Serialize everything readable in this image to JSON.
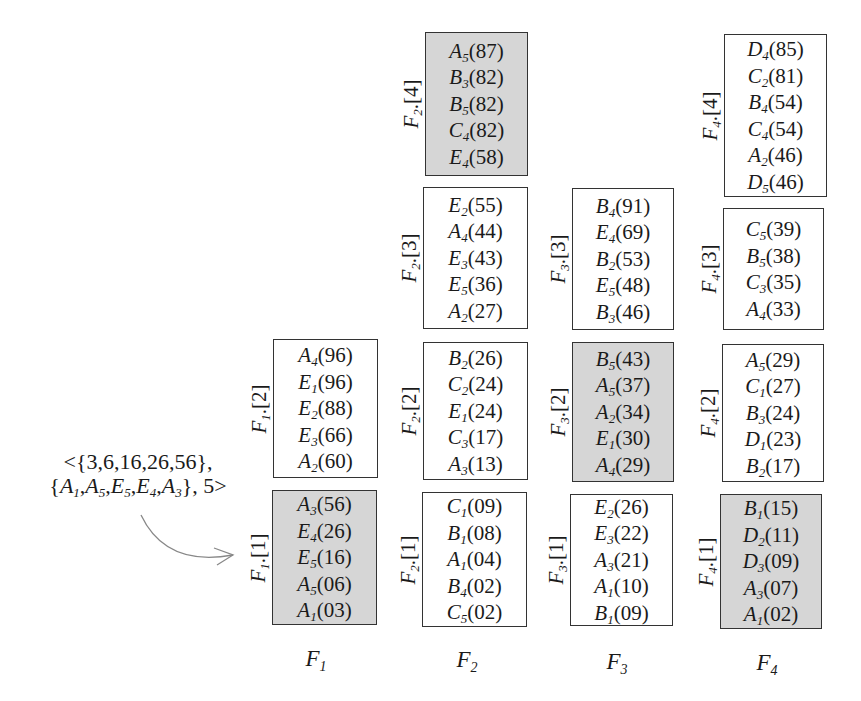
{
  "annotation": {
    "line1": "<{3,6,16,26,56},",
    "line2_sets": [
      {
        "letter": "A",
        "sub": "1"
      },
      {
        "letter": "A",
        "sub": "5"
      },
      {
        "letter": "E",
        "sub": "5"
      },
      {
        "letter": "E",
        "sub": "4"
      },
      {
        "letter": "A",
        "sub": "3"
      }
    ],
    "line2_suffix": ", 5>",
    "arrow_target": "F1.[1]"
  },
  "columns": [
    {
      "name": "F",
      "sub": "1",
      "cells": [
        {
          "label_prefix": "F",
          "label_sub": "1",
          "index": "[2]",
          "highlighted": false,
          "entries": [
            {
              "letter": "A",
              "sub": "4",
              "value": "(96)"
            },
            {
              "letter": "E",
              "sub": "1",
              "value": "(96)"
            },
            {
              "letter": "E",
              "sub": "2",
              "value": "(88)"
            },
            {
              "letter": "E",
              "sub": "3",
              "value": "(66)"
            },
            {
              "letter": "A",
              "sub": "2",
              "value": "(60)"
            }
          ]
        },
        {
          "label_prefix": "F",
          "label_sub": "1",
          "index": "[1]",
          "highlighted": true,
          "entries": [
            {
              "letter": "A",
              "sub": "3",
              "value": "(56)"
            },
            {
              "letter": "E",
              "sub": "4",
              "value": "(26)"
            },
            {
              "letter": "E",
              "sub": "5",
              "value": "(16)"
            },
            {
              "letter": "A",
              "sub": "5",
              "value": "(06)"
            },
            {
              "letter": "A",
              "sub": "1",
              "value": "(03)"
            }
          ]
        }
      ]
    },
    {
      "name": "F",
      "sub": "2",
      "cells": [
        {
          "label_prefix": "F",
          "label_sub": "2",
          "index": "[4]",
          "highlighted": true,
          "entries": [
            {
              "letter": "A",
              "sub": "5",
              "value": "(87)"
            },
            {
              "letter": "B",
              "sub": "3",
              "value": "(82)"
            },
            {
              "letter": "B",
              "sub": "5",
              "value": "(82)"
            },
            {
              "letter": "C",
              "sub": "4",
              "value": "(82)"
            },
            {
              "letter": "E",
              "sub": "4",
              "value": "(58)"
            }
          ]
        },
        {
          "label_prefix": "F",
          "label_sub": "2",
          "index": "[3]",
          "highlighted": false,
          "entries": [
            {
              "letter": "E",
              "sub": "2",
              "value": "(55)"
            },
            {
              "letter": "A",
              "sub": "4",
              "value": "(44)"
            },
            {
              "letter": "E",
              "sub": "3",
              "value": "(43)"
            },
            {
              "letter": "E",
              "sub": "5",
              "value": "(36)"
            },
            {
              "letter": "A",
              "sub": "2",
              "value": "(27)"
            }
          ]
        },
        {
          "label_prefix": "F",
          "label_sub": "2",
          "index": "[2]",
          "highlighted": false,
          "entries": [
            {
              "letter": "B",
              "sub": "2",
              "value": "(26)"
            },
            {
              "letter": "C",
              "sub": "2",
              "value": "(24)"
            },
            {
              "letter": "E",
              "sub": "1",
              "value": "(24)"
            },
            {
              "letter": "C",
              "sub": "3",
              "value": "(17)"
            },
            {
              "letter": "A",
              "sub": "3",
              "value": "(13)"
            }
          ]
        },
        {
          "label_prefix": "F",
          "label_sub": "2",
          "index": "[1]",
          "highlighted": false,
          "entries": [
            {
              "letter": "C",
              "sub": "1",
              "value": "(09)"
            },
            {
              "letter": "B",
              "sub": "1",
              "value": "(08)"
            },
            {
              "letter": "A",
              "sub": "1",
              "value": "(04)"
            },
            {
              "letter": "B",
              "sub": "4",
              "value": "(02)"
            },
            {
              "letter": "C",
              "sub": "5",
              "value": "(02)"
            }
          ]
        }
      ]
    },
    {
      "name": "F",
      "sub": "3",
      "cells": [
        {
          "label_prefix": "F",
          "label_sub": "3",
          "index": "[3]",
          "highlighted": false,
          "entries": [
            {
              "letter": "B",
              "sub": "4",
              "value": "(91)"
            },
            {
              "letter": "E",
              "sub": "4",
              "value": "(69)"
            },
            {
              "letter": "B",
              "sub": "2",
              "value": "(53)"
            },
            {
              "letter": "E",
              "sub": "5",
              "value": "(48)"
            },
            {
              "letter": "B",
              "sub": "3",
              "value": "(46)"
            }
          ]
        },
        {
          "label_prefix": "F",
          "label_sub": "3",
          "index": "[2]",
          "highlighted": true,
          "entries": [
            {
              "letter": "B",
              "sub": "5",
              "value": "(43)"
            },
            {
              "letter": "A",
              "sub": "5",
              "value": "(37)"
            },
            {
              "letter": "A",
              "sub": "2",
              "value": "(34)"
            },
            {
              "letter": "E",
              "sub": "1",
              "value": "(30)"
            },
            {
              "letter": "A",
              "sub": "4",
              "value": "(29)"
            }
          ]
        },
        {
          "label_prefix": "F",
          "label_sub": "3",
          "index": "[1]",
          "highlighted": false,
          "entries": [
            {
              "letter": "E",
              "sub": "2",
              "value": "(26)"
            },
            {
              "letter": "E",
              "sub": "3",
              "value": "(22)"
            },
            {
              "letter": "A",
              "sub": "3",
              "value": "(21)"
            },
            {
              "letter": "A",
              "sub": "1",
              "value": "(10)"
            },
            {
              "letter": "B",
              "sub": "1",
              "value": "(09)"
            }
          ]
        }
      ]
    },
    {
      "name": "F",
      "sub": "4",
      "cells": [
        {
          "label_prefix": "F",
          "label_sub": "4",
          "index": "[4]",
          "highlighted": false,
          "entries": [
            {
              "letter": "D",
              "sub": "4",
              "value": "(85)"
            },
            {
              "letter": "C",
              "sub": "2",
              "value": "(81)"
            },
            {
              "letter": "B",
              "sub": "4",
              "value": "(54)"
            },
            {
              "letter": "C",
              "sub": "4",
              "value": "(54)"
            },
            {
              "letter": "A",
              "sub": "2",
              "value": "(46)"
            },
            {
              "letter": "D",
              "sub": "5",
              "value": "(46)"
            }
          ]
        },
        {
          "label_prefix": "F",
          "label_sub": "4",
          "index": "[3]",
          "highlighted": false,
          "entries": [
            {
              "letter": "C",
              "sub": "5",
              "value": "(39)"
            },
            {
              "letter": "B",
              "sub": "5",
              "value": "(38)"
            },
            {
              "letter": "C",
              "sub": "3",
              "value": "(35)"
            },
            {
              "letter": "A",
              "sub": "4",
              "value": "(33)"
            }
          ]
        },
        {
          "label_prefix": "F",
          "label_sub": "4",
          "index": "[2]",
          "highlighted": false,
          "entries": [
            {
              "letter": "A",
              "sub": "5",
              "value": "(29)"
            },
            {
              "letter": "C",
              "sub": "1",
              "value": "(27)"
            },
            {
              "letter": "B",
              "sub": "3",
              "value": "(24)"
            },
            {
              "letter": "D",
              "sub": "1",
              "value": "(23)"
            },
            {
              "letter": "B",
              "sub": "2",
              "value": "(17)"
            }
          ]
        },
        {
          "label_prefix": "F",
          "label_sub": "4",
          "index": "[1]",
          "highlighted": true,
          "entries": [
            {
              "letter": "B",
              "sub": "1",
              "value": "(15)"
            },
            {
              "letter": "D",
              "sub": "2",
              "value": "(11)"
            },
            {
              "letter": "D",
              "sub": "3",
              "value": "(09)"
            },
            {
              "letter": "A",
              "sub": "3",
              "value": "(07)"
            },
            {
              "letter": "A",
              "sub": "1",
              "value": "(02)"
            }
          ]
        }
      ]
    }
  ],
  "colors": {
    "highlight_fill": "#d6d6d6",
    "border": "#333333",
    "arrow": "#888888"
  }
}
